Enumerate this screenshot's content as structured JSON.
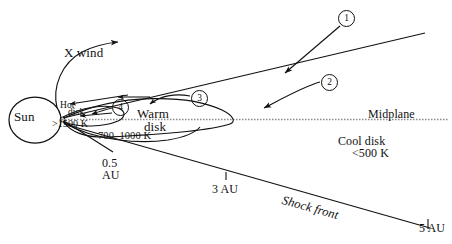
{
  "figure": {
    "type": "schematic-diagram"
  },
  "labels": {
    "sun": "Sun",
    "x_wind": "X wind",
    "hot_line1": "Hot",
    "hot_line2": "disk",
    "hot_temp": ">1500 K",
    "warm_line1": "Warm",
    "warm_line2": "disk",
    "warm_temp": "700–1000 K",
    "midplane": "Midplane",
    "cool_line1": "Cool disk",
    "cool_temp": "<500 K",
    "shock_front": "Shock front"
  },
  "axis_markers": {
    "au_05_line1": "0.5",
    "au_05_line2": "AU",
    "au_3": "3 AU",
    "au_5": "5 AU"
  },
  "callouts": [
    {
      "id": "1",
      "symbol": "①",
      "text": "1"
    },
    {
      "id": "2",
      "symbol": "②",
      "text": "2"
    },
    {
      "id": "3",
      "symbol": "③",
      "text": "3"
    },
    {
      "id": "4",
      "symbol": "④",
      "text": "4"
    }
  ],
  "colors": {
    "ink": "#111111",
    "midplane_line": "#8a8a8a",
    "background": "#ffffff"
  }
}
